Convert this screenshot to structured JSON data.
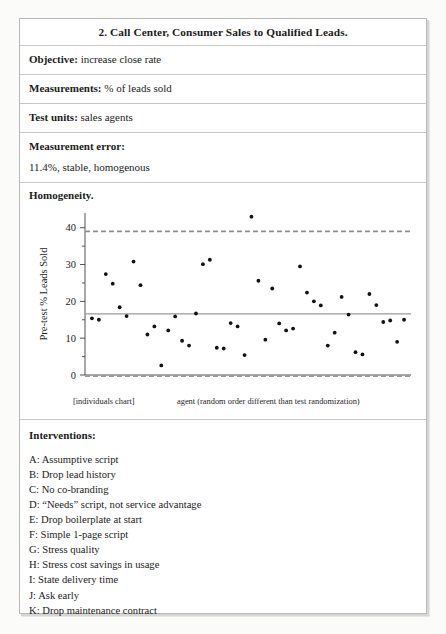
{
  "document": {
    "title": "2. Call Center, Consumer Sales to Qualified Leads.",
    "fields": [
      {
        "label": "Objective:",
        "value": "increase close rate"
      },
      {
        "label": "Measurements:",
        "value": "% of leads sold"
      },
      {
        "label": "Test units:",
        "value": "sales agents"
      }
    ],
    "measurement_error": {
      "label": "Measurement error:",
      "value": "11.4%, stable, homogenous"
    },
    "homogeneity_label": "Homogeneity.",
    "interventions": {
      "heading": "Interventions:",
      "items": [
        "A: Assumptive script",
        "B: Drop lead history",
        "C: No co-branding",
        "D: “Needs” script, not service advantage",
        "E: Drop boilerplate at start",
        "F: Simple 1-page script",
        "G: Stress quality",
        "H: Stress cost savings in usage",
        "I: State delivery time",
        "J: Ask early",
        "K: Drop maintenance contract"
      ]
    }
  },
  "chart_data": {
    "type": "scatter",
    "title": "",
    "xlabel": "agent (random order different than test randomization)",
    "ylabel": "Pre-test % Leads Sold",
    "ylim": [
      0,
      44
    ],
    "yticks": [
      0,
      10,
      20,
      30,
      40
    ],
    "ytick_labels": [
      "0",
      "10",
      "20",
      "30",
      "40"
    ],
    "minor_ticks": [
      5,
      15,
      25,
      35
    ],
    "xlim": [
      0,
      47
    ],
    "xticks": [],
    "grid": false,
    "legend": false,
    "caption_left": "[individuals chart]",
    "caption_right": "agent (random order different than test randomization)",
    "reference_lines": [
      {
        "name": "upper-control-limit",
        "value": 39.0,
        "style": "dashed",
        "color": "#8f8f8f"
      },
      {
        "name": "center-line",
        "value": 16.6,
        "style": "solid",
        "color": "#9a9a9a"
      },
      {
        "name": "lower-control-limit",
        "value": -0.3,
        "style": "dashed",
        "color": "#9a9a9a"
      }
    ],
    "point_color": "#121212",
    "series": [
      {
        "name": "Pre-test % Leads Sold",
        "x": [
          1,
          2,
          3,
          4,
          5,
          6,
          7,
          8,
          9,
          10,
          11,
          12,
          13,
          14,
          15,
          16,
          17,
          18,
          19,
          20,
          21,
          22,
          23,
          24,
          25,
          26,
          27,
          28,
          29,
          30,
          31,
          32,
          33,
          34,
          35,
          36,
          37,
          38,
          39,
          40,
          41,
          42,
          43,
          44,
          45,
          46
        ],
        "values": [
          15.4,
          15.0,
          27.4,
          24.8,
          18.4,
          16.0,
          30.8,
          24.4,
          11.0,
          13.2,
          2.6,
          12.1,
          15.9,
          9.3,
          8.0,
          16.7,
          30.1,
          31.3,
          7.4,
          7.2,
          14.1,
          13.2,
          5.4,
          43.0,
          25.6,
          9.6,
          23.5,
          14.0,
          12.1,
          12.6,
          29.5,
          22.4,
          20.0,
          18.9,
          8.0,
          11.5,
          21.2,
          16.4,
          6.2,
          5.6,
          22.0,
          19.0,
          14.4,
          14.8,
          9.0,
          15.0
        ]
      }
    ]
  }
}
